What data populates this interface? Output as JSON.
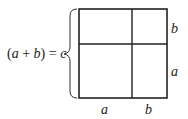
{
  "diagram": {
    "equation": {
      "open": "(",
      "a": "a",
      "plus": " + ",
      "b": "b",
      "close": ")",
      "equals": " = ",
      "c": "c"
    },
    "right_labels": {
      "top": "b",
      "bottom": "a"
    },
    "bottom_labels": {
      "left": "a",
      "right": "b"
    },
    "line_color": "#222222"
  }
}
